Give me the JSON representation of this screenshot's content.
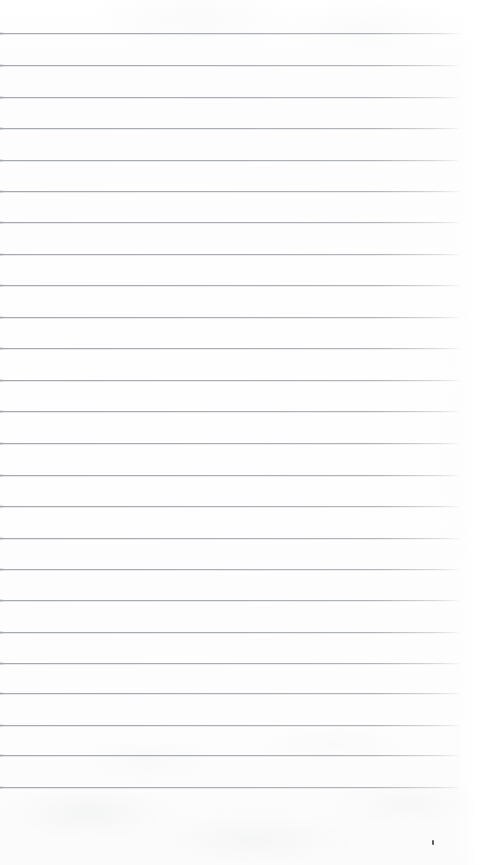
{
  "document": {
    "kind": "scanned-ruled-notebook-page",
    "description": "Blank lined notebook paper scan",
    "content_text": "",
    "page_width": 489,
    "page_height": 865,
    "paper_color": "#fefefe",
    "rule_color": "#9ea2a7",
    "rule_count": 24,
    "rule_spacing": 31.7,
    "first_rule_y": 33,
    "rule_start_x": 0,
    "rule_end_x": 459,
    "bottom_margin_start_y": 787
  },
  "rules": [
    {
      "index": 1,
      "y": 33,
      "width": 459
    },
    {
      "index": 2,
      "y": 65,
      "width": 459
    },
    {
      "index": 3,
      "y": 97,
      "width": 459
    },
    {
      "index": 4,
      "y": 128,
      "width": 459
    },
    {
      "index": 5,
      "y": 160,
      "width": 459
    },
    {
      "index": 6,
      "y": 191,
      "width": 459
    },
    {
      "index": 7,
      "y": 222,
      "width": 459
    },
    {
      "index": 8,
      "y": 254,
      "width": 459
    },
    {
      "index": 9,
      "y": 285,
      "width": 459
    },
    {
      "index": 10,
      "y": 317,
      "width": 459
    },
    {
      "index": 11,
      "y": 348,
      "width": 459
    },
    {
      "index": 12,
      "y": 380,
      "width": 459
    },
    {
      "index": 13,
      "y": 411,
      "width": 459
    },
    {
      "index": 14,
      "y": 443,
      "width": 459
    },
    {
      "index": 15,
      "y": 475,
      "width": 459
    },
    {
      "index": 16,
      "y": 506,
      "width": 459
    },
    {
      "index": 17,
      "y": 538,
      "width": 459
    },
    {
      "index": 18,
      "y": 569,
      "width": 459
    },
    {
      "index": 19,
      "y": 600,
      "width": 459
    },
    {
      "index": 20,
      "y": 632,
      "width": 459
    },
    {
      "index": 21,
      "y": 663,
      "width": 459
    },
    {
      "index": 22,
      "y": 693,
      "width": 459
    },
    {
      "index": 23,
      "y": 725,
      "width": 459
    },
    {
      "index": 24,
      "y": 755,
      "width": 459
    },
    {
      "index": 25,
      "y": 787,
      "width": 459
    }
  ],
  "artifacts": [
    {
      "name": "ink-speck",
      "x": 432,
      "y": 840,
      "width": 2,
      "height": 5,
      "color": "#3d4044"
    }
  ]
}
